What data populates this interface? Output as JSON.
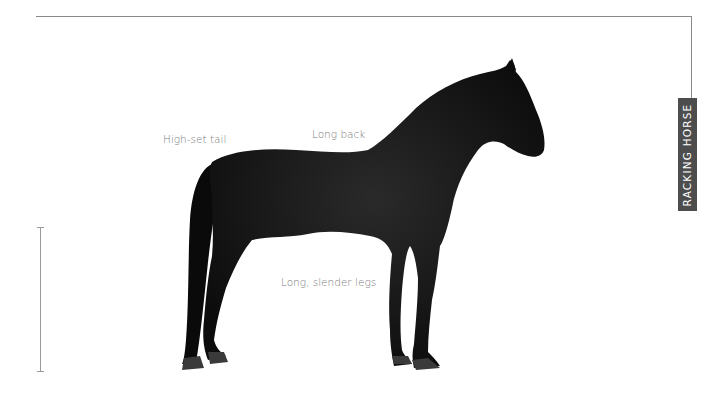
{
  "panel": {
    "title": "RACKING HORSE",
    "title_bg": "#4d4d4d",
    "rule_color": "#8a8a8a"
  },
  "annotations": [
    {
      "label": "High-set tail",
      "x": 163,
      "y": 133
    },
    {
      "label": "Long back",
      "x": 312,
      "y": 128
    },
    {
      "label": "Long, slender legs",
      "x": 281,
      "y": 276
    }
  ],
  "image": {
    "subject": "black horse silhouette, standing, side view facing right",
    "color": "#111111"
  },
  "height_scale": {
    "top_y": 227,
    "bottom_y": 372
  }
}
